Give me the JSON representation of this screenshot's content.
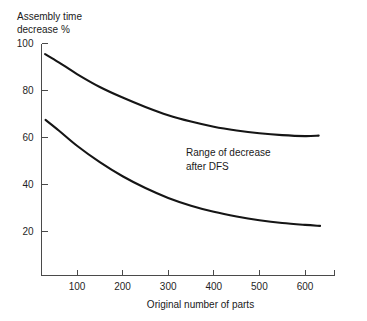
{
  "chart_data": {
    "type": "line",
    "title": "",
    "xlabel": "Original number of parts",
    "ylabel": "Assembly time decrease %",
    "ylabel_line1": "Assembly time",
    "ylabel_line2": "decrease %",
    "xlim": [
      0,
      670
    ],
    "ylim": [
      0,
      105
    ],
    "xticks": [
      100,
      200,
      300,
      400,
      500,
      600
    ],
    "xticklabels": [
      "100",
      "200",
      "300",
      "400",
      "500",
      "600"
    ],
    "yticks": [
      20,
      40,
      60,
      80,
      100
    ],
    "yticklabels": [
      "20",
      "40",
      "60",
      "80",
      "100"
    ],
    "grid": false,
    "legend": "none",
    "annotations": [
      {
        "name": "range-annotation",
        "line1": "Range of decrease",
        "line2": "after DFS",
        "x": 250,
        "y": 55
      }
    ],
    "series": [
      {
        "name": "upper-bound",
        "label": "Upper bound of decrease range",
        "color": "#151515",
        "x": [
          30,
          60,
          100,
          150,
          200,
          250,
          300,
          350,
          400,
          450,
          500,
          550,
          600,
          630
        ],
        "y": [
          95.5,
          92.0,
          87.0,
          81.5,
          77.0,
          73.0,
          69.5,
          66.8,
          64.6,
          63.0,
          61.8,
          61.0,
          60.6,
          60.8
        ]
      },
      {
        "name": "lower-bound",
        "label": "Lower bound of decrease range",
        "color": "#151515",
        "x": [
          31,
          60,
          100,
          150,
          200,
          250,
          300,
          350,
          400,
          450,
          500,
          550,
          600,
          633
        ],
        "y": [
          67.5,
          63.0,
          56.5,
          49.5,
          43.5,
          38.5,
          34.3,
          31.0,
          28.4,
          26.4,
          24.8,
          23.6,
          22.8,
          22.4
        ]
      }
    ]
  }
}
